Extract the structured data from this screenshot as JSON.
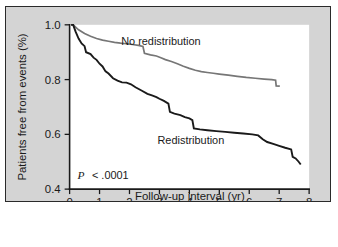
{
  "figure": {
    "background_color": "#d4d4d4",
    "plot_background_color": "#ffffff",
    "border_color": "#2a2a2a"
  },
  "annotations": {
    "pvalue_symbol": "P",
    "pvalue_text": "< .0001"
  },
  "chart_data": {
    "type": "line",
    "title": "",
    "subtitle": "",
    "xlabel": "Follow-up interval (yr)",
    "ylabel": "Patients free from events (%)",
    "xlim": [
      0,
      8
    ],
    "ylim": [
      0.4,
      1.0
    ],
    "xticks": [
      0,
      1,
      2,
      3,
      4,
      5,
      6,
      7,
      8
    ],
    "xtick_labels": [
      "0",
      "1",
      "2",
      "3",
      "4",
      "5",
      "6",
      "7",
      "8"
    ],
    "yticks": [
      0.4,
      0.6,
      0.8,
      1.0
    ],
    "ytick_labels": [
      "0.4",
      "0.6",
      "0.8",
      "1.0"
    ],
    "grid": false,
    "legend_position": "inline-annotation",
    "annotation_text": "P < .0001",
    "series": [
      {
        "name": "No redistribution",
        "color": "#767676",
        "line_width": 1.7,
        "label_x": 3.05,
        "label_y": 0.925,
        "points": [
          [
            0.05,
            1.0
          ],
          [
            0.12,
            1.0
          ],
          [
            0.3,
            0.982
          ],
          [
            0.5,
            0.968
          ],
          [
            0.7,
            0.958
          ],
          [
            0.9,
            0.95
          ],
          [
            1.1,
            0.944
          ],
          [
            1.3,
            0.94
          ],
          [
            1.5,
            0.936
          ],
          [
            1.7,
            0.933
          ],
          [
            1.9,
            0.931
          ],
          [
            2.1,
            0.928
          ],
          [
            2.3,
            0.925
          ],
          [
            2.45,
            0.921
          ],
          [
            2.5,
            0.896
          ],
          [
            2.7,
            0.89
          ],
          [
            2.9,
            0.886
          ],
          [
            3.05,
            0.88
          ],
          [
            3.2,
            0.873
          ],
          [
            3.4,
            0.866
          ],
          [
            3.6,
            0.858
          ],
          [
            3.8,
            0.849
          ],
          [
            4.0,
            0.841
          ],
          [
            4.2,
            0.834
          ],
          [
            4.4,
            0.829
          ],
          [
            4.6,
            0.826
          ],
          [
            4.8,
            0.823
          ],
          [
            5.0,
            0.82
          ],
          [
            5.3,
            0.816
          ],
          [
            5.6,
            0.812
          ],
          [
            5.9,
            0.808
          ],
          [
            6.2,
            0.805
          ],
          [
            6.5,
            0.802
          ],
          [
            6.75,
            0.8
          ],
          [
            6.88,
            0.798
          ],
          [
            6.9,
            0.777
          ],
          [
            7.02,
            0.776
          ]
        ]
      },
      {
        "name": "Redistribution",
        "color": "#1a1a1a",
        "line_width": 1.9,
        "label_x": 4.05,
        "label_y": 0.565,
        "points": [
          [
            0.05,
            1.0
          ],
          [
            0.12,
            1.0
          ],
          [
            0.2,
            0.975
          ],
          [
            0.3,
            0.95
          ],
          [
            0.4,
            0.932
          ],
          [
            0.5,
            0.922
          ],
          [
            0.55,
            0.9
          ],
          [
            0.7,
            0.893
          ],
          [
            0.8,
            0.88
          ],
          [
            0.9,
            0.872
          ],
          [
            1.0,
            0.858
          ],
          [
            1.1,
            0.848
          ],
          [
            1.2,
            0.83
          ],
          [
            1.3,
            0.822
          ],
          [
            1.45,
            0.805
          ],
          [
            1.6,
            0.796
          ],
          [
            1.75,
            0.79
          ],
          [
            1.9,
            0.789
          ],
          [
            2.05,
            0.783
          ],
          [
            2.2,
            0.772
          ],
          [
            2.4,
            0.76
          ],
          [
            2.6,
            0.748
          ],
          [
            2.75,
            0.742
          ],
          [
            2.9,
            0.736
          ],
          [
            3.0,
            0.73
          ],
          [
            3.15,
            0.722
          ],
          [
            3.3,
            0.712
          ],
          [
            3.35,
            0.682
          ],
          [
            3.5,
            0.676
          ],
          [
            3.7,
            0.67
          ],
          [
            3.85,
            0.663
          ],
          [
            4.0,
            0.658
          ],
          [
            4.1,
            0.652
          ],
          [
            4.15,
            0.622
          ],
          [
            4.35,
            0.618
          ],
          [
            4.6,
            0.615
          ],
          [
            4.9,
            0.612
          ],
          [
            5.2,
            0.609
          ],
          [
            5.5,
            0.606
          ],
          [
            5.8,
            0.603
          ],
          [
            6.1,
            0.6
          ],
          [
            6.3,
            0.596
          ],
          [
            6.45,
            0.582
          ],
          [
            6.6,
            0.572
          ],
          [
            6.8,
            0.565
          ],
          [
            7.0,
            0.558
          ],
          [
            7.2,
            0.551
          ],
          [
            7.4,
            0.545
          ],
          [
            7.45,
            0.518
          ],
          [
            7.55,
            0.512
          ],
          [
            7.65,
            0.5
          ],
          [
            7.72,
            0.49
          ]
        ]
      }
    ]
  }
}
